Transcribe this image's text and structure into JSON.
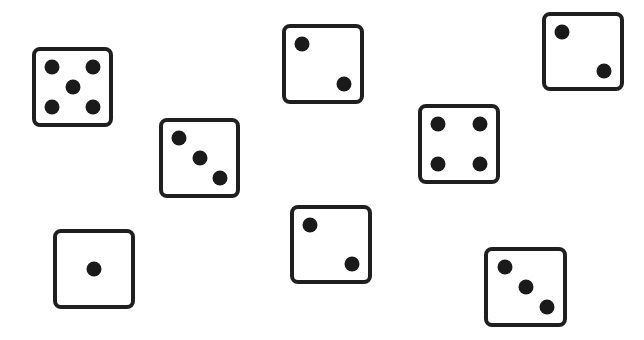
{
  "scene": {
    "background": "#ffffff",
    "die_border_color": "#1f1f1f",
    "pip_color": "#1a1a1a",
    "dice": [
      {
        "id": "die-1",
        "value": 5,
        "x": 32,
        "y": 47,
        "w": 81,
        "h": 80
      },
      {
        "id": "die-2",
        "value": 3,
        "x": 159,
        "y": 118,
        "w": 81,
        "h": 80
      },
      {
        "id": "die-3",
        "value": 2,
        "x": 282,
        "y": 24,
        "w": 82,
        "h": 80
      },
      {
        "id": "die-4",
        "value": 2,
        "x": 542,
        "y": 12,
        "w": 82,
        "h": 79
      },
      {
        "id": "die-5",
        "value": 4,
        "x": 418,
        "y": 104,
        "w": 82,
        "h": 80
      },
      {
        "id": "die-6",
        "value": 1,
        "x": 53,
        "y": 229,
        "w": 82,
        "h": 80
      },
      {
        "id": "die-7",
        "value": 2,
        "x": 290,
        "y": 205,
        "w": 82,
        "h": 79
      },
      {
        "id": "die-8",
        "value": 3,
        "x": 484,
        "y": 247,
        "w": 83,
        "h": 80
      }
    ]
  }
}
